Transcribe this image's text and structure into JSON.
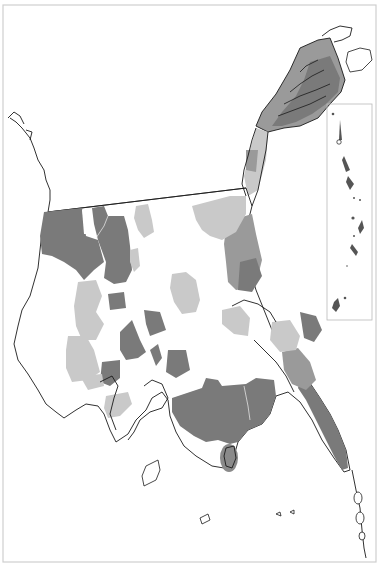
{
  "map": {
    "width": 383,
    "height": 570,
    "frame": {
      "x": 3,
      "y": 5,
      "w": 373,
      "h": 557
    },
    "inset_frame": {
      "x": 327,
      "y": 104,
      "w": 45,
      "h": 216
    },
    "legend": null,
    "labels": []
  },
  "colors": {
    "background": "#ffffff",
    "frame": "#cfcfcf",
    "coastline": "#1a1a1a",
    "class_dark": "#7a7a7a",
    "class_mid": "#9a9a9a",
    "class_light": "#c9c9c9"
  },
  "regions": {
    "dark": [
      "northwest-block",
      "northwest-inner-block",
      "north-central-block",
      "central-west-small",
      "central-south-1",
      "central-south-2",
      "central-south-3",
      "central-south-4",
      "southern-tip",
      "south-east",
      "southern-island",
      "east-coast-strip",
      "northeast-peninsula",
      "east-island-cluster"
    ],
    "mid": [
      "northeast-peninsula-lower",
      "east-coastal-belt",
      "east-coast-mid",
      "north-east-corridor"
    ],
    "light": [
      "north-central-light",
      "northeast-light",
      "central-light",
      "west-light-1",
      "west-light-2",
      "east-light",
      "southwest-light",
      "east-coast-light",
      "central-east-light"
    ]
  }
}
